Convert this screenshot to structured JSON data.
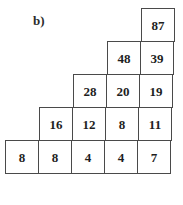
{
  "figure": {
    "part_label": "b)",
    "type": "number-pyramid",
    "caption": ""
  },
  "colors": {
    "background": "#ffffff",
    "cell_border": "#4a4a4a",
    "text": "#1e1e1e",
    "label_text": "#2b2b2b"
  },
  "chart_data": {
    "type": "table",
    "title": "b)",
    "xlabel": "",
    "ylabel": "",
    "rows": [
      {
        "level": 1,
        "values": [
          87
        ]
      },
      {
        "level": 2,
        "values": [
          48,
          39
        ]
      },
      {
        "level": 3,
        "values": [
          28,
          20,
          19
        ]
      },
      {
        "level": 4,
        "values": [
          16,
          12,
          8,
          11
        ]
      },
      {
        "level": 5,
        "values": [
          8,
          8,
          4,
          4,
          7
        ]
      }
    ],
    "categories": [
      "level 1",
      "level 2",
      "level 3",
      "level 4",
      "level 5"
    ],
    "apex_value": 87,
    "base_values": [
      8,
      8,
      4,
      4,
      7
    ]
  }
}
